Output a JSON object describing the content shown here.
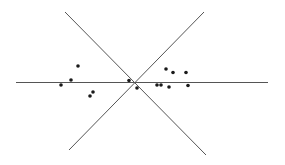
{
  "diagram": {
    "colors": {
      "background": "#ffffff",
      "line": "#555555",
      "point": "#1a1a1a"
    },
    "lines": [
      {
        "name": "horizontal-line",
        "x1": 16,
        "y1": 82.5,
        "x2": 268,
        "y2": 82.5
      },
      {
        "name": "diagonal-line-descending",
        "x1": 65,
        "y1": 12,
        "x2": 206,
        "y2": 155
      },
      {
        "name": "diagonal-line-ascending",
        "x1": 204,
        "y1": 12,
        "x2": 69,
        "y2": 150
      }
    ],
    "points": [
      {
        "x": 61,
        "y": 85
      },
      {
        "x": 71,
        "y": 80
      },
      {
        "x": 78,
        "y": 66
      },
      {
        "x": 90,
        "y": 96
      },
      {
        "x": 93,
        "y": 92
      },
      {
        "x": 129,
        "y": 80.5
      },
      {
        "x": 137,
        "y": 88
      },
      {
        "x": 157,
        "y": 85
      },
      {
        "x": 161,
        "y": 85
      },
      {
        "x": 166,
        "y": 69
      },
      {
        "x": 169,
        "y": 87
      },
      {
        "x": 173,
        "y": 72.5
      },
      {
        "x": 186,
        "y": 72.5
      },
      {
        "x": 188,
        "y": 85.5
      }
    ],
    "point_radius": 1.8
  }
}
